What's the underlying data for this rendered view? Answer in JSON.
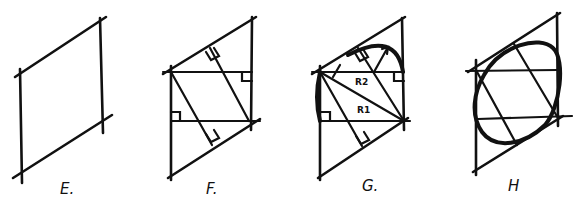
{
  "figure": {
    "panels": [
      {
        "id": "E",
        "label": "E."
      },
      {
        "id": "F",
        "label": "F."
      },
      {
        "id": "G",
        "label": "G.",
        "radius_labels": [
          "R2",
          "R1"
        ]
      },
      {
        "id": "H",
        "label": "H"
      }
    ],
    "colors": {
      "ink": "#111111",
      "background": "#ffffff"
    }
  }
}
